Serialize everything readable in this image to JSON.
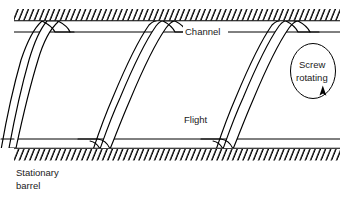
{
  "figure": {
    "type": "technical-line-diagram",
    "width": 352,
    "height": 197,
    "background_color": "#ffffff",
    "line_color": "#000000",
    "text_color": "#1a1a1a"
  },
  "labels": {
    "channel": "Channel",
    "flight": "Flight",
    "screw_rotating_line1": "Screw",
    "screw_rotating_line2": "rotating",
    "stationary_barrel_line1": "Stationary",
    "stationary_barrel_line2": "barrel"
  },
  "components": {
    "top_barrel": {
      "name": "Stationary barrel (top wall)",
      "hatching": "diagonal",
      "hatch_direction": "lower-left to upper-right",
      "line_y": 21,
      "hatch_count": 57
    },
    "bottom_barrel": {
      "name": "Stationary barrel (bottom wall)",
      "hatching": "diagonal",
      "hatch_direction": "lower-left to upper-right",
      "line_y": 148,
      "hatch_count": 57
    },
    "screw_root_top": {
      "name": "Screw root line (top)",
      "line_y": 32
    },
    "screw_root_bottom": {
      "name": "Screw root line (bottom)",
      "line_y": 139
    },
    "flights": {
      "name": "Helical screw flights",
      "count": 3,
      "x_positions": [
        38,
        160,
        283
      ],
      "description": "S-shaped helical flight cross-sections sweeping from lower-left to upper-right"
    },
    "rotation_indicator": {
      "name": "Screw rotation arrow",
      "shape": "ellipse with arrowhead",
      "center_x": 313,
      "center_y": 72,
      "rx": 23,
      "ry": 28,
      "arrow_direction": "counter-clockwise-up"
    }
  }
}
